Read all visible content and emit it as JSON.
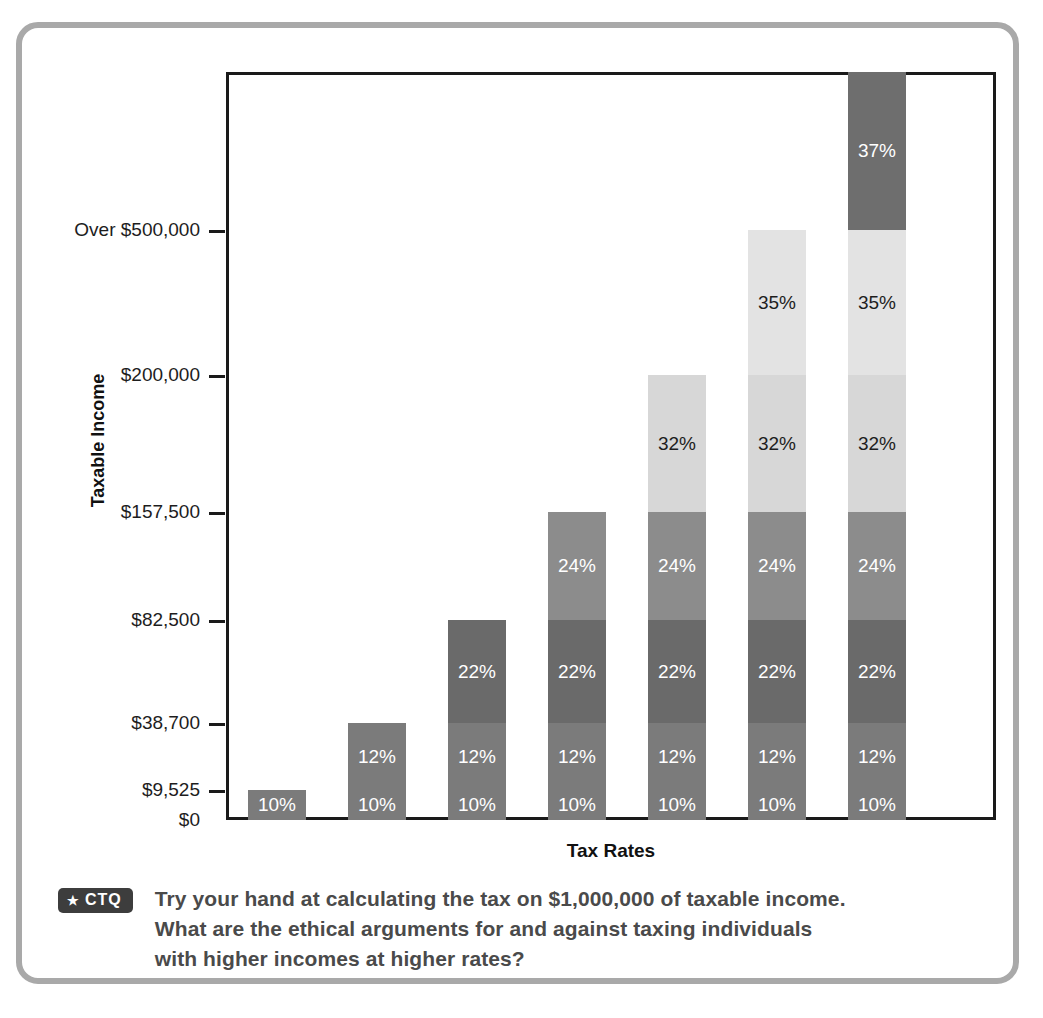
{
  "figure": {
    "border_color": "#a9a9a9",
    "axis_color": "#1a1a1a"
  },
  "chart_data": {
    "type": "bar",
    "subtype": "stacked-bar",
    "title": "",
    "xlabel": "Tax Rates",
    "ylabel": "Taxable Income",
    "grid": false,
    "legend": "none",
    "y_tick_labels": [
      "$0",
      "$9,525",
      "$38,700",
      "$82,500",
      "$157,500",
      "$200,000",
      "Over $500,000"
    ],
    "y_tick_values": [
      0,
      9525,
      38700,
      82500,
      157500,
      200000,
      500000
    ],
    "ylim": [
      0,
      560000
    ],
    "categories": [
      "Bracket 1",
      "Bracket 2",
      "Bracket 3",
      "Bracket 4",
      "Bracket 5",
      "Bracket 6",
      "Bracket 7"
    ],
    "segment_labels": [
      "10%",
      "12%",
      "22%",
      "24%",
      "32%",
      "35%",
      "37%"
    ],
    "segment_colors": [
      "#7b7b7b",
      "#7b7b7b",
      "#6a6a6a",
      "#8c8c8c",
      "#d7d7d7",
      "#e3e3e3",
      "#6e6e6e"
    ],
    "segment_text_colors": [
      "#ffffff",
      "#ffffff",
      "#ffffff",
      "#ffffff",
      "#1d1d1d",
      "#1d1d1d",
      "#ffffff"
    ],
    "bars": [
      {
        "name": "bar-1",
        "top_value": 9525,
        "segments": [
          {
            "label": "10%",
            "from": 0,
            "to": 9525
          }
        ]
      },
      {
        "name": "bar-2",
        "top_value": 38700,
        "segments": [
          {
            "label": "10%",
            "from": 0,
            "to": 9525
          },
          {
            "label": "12%",
            "from": 9525,
            "to": 38700
          }
        ]
      },
      {
        "name": "bar-3",
        "top_value": 82500,
        "segments": [
          {
            "label": "10%",
            "from": 0,
            "to": 9525
          },
          {
            "label": "12%",
            "from": 9525,
            "to": 38700
          },
          {
            "label": "22%",
            "from": 38700,
            "to": 82500
          }
        ]
      },
      {
        "name": "bar-4",
        "top_value": 157500,
        "segments": [
          {
            "label": "10%",
            "from": 0,
            "to": 9525
          },
          {
            "label": "12%",
            "from": 9525,
            "to": 38700
          },
          {
            "label": "22%",
            "from": 38700,
            "to": 82500
          },
          {
            "label": "24%",
            "from": 82500,
            "to": 157500
          }
        ]
      },
      {
        "name": "bar-5",
        "top_value": 200000,
        "segments": [
          {
            "label": "10%",
            "from": 0,
            "to": 9525
          },
          {
            "label": "12%",
            "from": 9525,
            "to": 38700
          },
          {
            "label": "22%",
            "from": 38700,
            "to": 82500
          },
          {
            "label": "24%",
            "from": 82500,
            "to": 157500
          },
          {
            "label": "32%",
            "from": 157500,
            "to": 200000
          }
        ]
      },
      {
        "name": "bar-6",
        "top_value": 500000,
        "segments": [
          {
            "label": "10%",
            "from": 0,
            "to": 9525
          },
          {
            "label": "12%",
            "from": 9525,
            "to": 38700
          },
          {
            "label": "22%",
            "from": 38700,
            "to": 82500
          },
          {
            "label": "24%",
            "from": 82500,
            "to": 157500
          },
          {
            "label": "32%",
            "from": 157500,
            "to": 200000
          },
          {
            "label": "35%",
            "from": 200000,
            "to": 500000
          }
        ]
      },
      {
        "name": "bar-7",
        "top_value": 560000,
        "segments": [
          {
            "label": "10%",
            "from": 0,
            "to": 9525
          },
          {
            "label": "12%",
            "from": 9525,
            "to": 38700
          },
          {
            "label": "22%",
            "from": 38700,
            "to": 82500
          },
          {
            "label": "24%",
            "from": 82500,
            "to": 157500
          },
          {
            "label": "32%",
            "from": 157500,
            "to": 200000
          },
          {
            "label": "35%",
            "from": 200000,
            "to": 500000
          },
          {
            "label": "37%",
            "from": 500000,
            "to": 560000
          }
        ]
      }
    ]
  },
  "footnote": {
    "badge_icon": "star-icon",
    "badge_star": "★",
    "badge_label": "CTQ",
    "lines": [
      "Try your hand at calculating the tax on $1,000,000 of taxable income.",
      "What are the ethical arguments for and against taxing individuals",
      "with higher incomes at higher rates?"
    ]
  }
}
